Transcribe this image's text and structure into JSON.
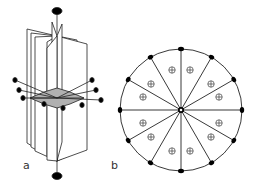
{
  "figure": {
    "panels": [
      {
        "id": "a",
        "label": "a",
        "description": "3D perspective of twelve vertical mirror planes sharing a vertical 6-fold axis, with horizontal 2-fold axes and a horizontal mirror plane"
      },
      {
        "id": "b",
        "label": "b",
        "description": "Stereographic projection: circle divided into 12 sectors with 2-fold axis markers on the rim, 6-fold center marker, and 12 circled-plus pole symbols"
      }
    ],
    "colors": {
      "line": "#222222",
      "fill": "#000000",
      "shade": "#b0b0b0",
      "background": "#ffffff"
    },
    "projection": {
      "sectors": 12,
      "rim_markers": 12,
      "poles": 12,
      "pole_symbol": "⊕"
    }
  }
}
